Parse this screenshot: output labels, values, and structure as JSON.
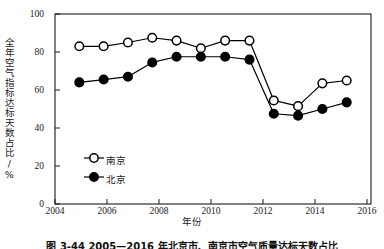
{
  "chart_data": {
    "type": "line",
    "title": "",
    "xlabel": "年份",
    "ylabel": "全年空气指标达标天数占比/%",
    "xlim": [
      2004,
      2017
    ],
    "ylim": [
      0,
      100
    ],
    "grid": false,
    "legend_position": "lower-left-inside",
    "x": [
      2005,
      2006,
      2007,
      2008,
      2009,
      2010,
      2011,
      2012,
      2013,
      2014,
      2015,
      2016
    ],
    "series": [
      {
        "name": "南京",
        "marker": "open-circle",
        "color": "#000000",
        "values": [
          83,
          83,
          85,
          87.5,
          86,
          82,
          86,
          86,
          54.5,
          51.5,
          63.5,
          65
        ]
      },
      {
        "name": "北京",
        "marker": "filled-circle",
        "color": "#000000",
        "values": [
          64,
          65.5,
          67,
          74.5,
          77.5,
          77.5,
          77.5,
          76,
          47.5,
          46.5,
          50,
          53.5
        ]
      }
    ],
    "xticks": [
      2004,
      2006,
      2008,
      2010,
      2012,
      2014,
      2016
    ],
    "xtick_labels": [
      "2004",
      "2006",
      "2008",
      "2010",
      "2012",
      "2014",
      "2016"
    ],
    "yticks": [
      0,
      20,
      40,
      60,
      80,
      100
    ],
    "ytick_labels": [
      "0",
      "20",
      "40",
      "60",
      "80",
      "100"
    ]
  },
  "legend": {
    "items": [
      {
        "label": "南京"
      },
      {
        "label": "北京"
      }
    ]
  },
  "caption": {
    "text": "图 3-44  2005—2016 年北京市、南京市空气质量达标天数占比"
  },
  "colors": {
    "axis": "#1a1a1a",
    "line": "#000000",
    "marker_fill_open": "#ffffff",
    "marker_fill_closed": "#000000",
    "background": "#ffffff"
  }
}
